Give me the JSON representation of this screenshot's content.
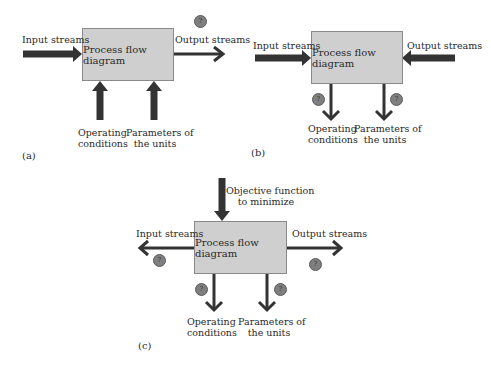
{
  "colors": {
    "box_fill": "#cfcfcf",
    "box_border": "#8a8a8a",
    "arrow": "#333333",
    "question_marker": "#7f7f7f"
  },
  "question_marker": {
    "icon": "question-circle-icon",
    "glyph": "?"
  },
  "panels": [
    {
      "tag": "(a)",
      "box_label": "Process flow diagram",
      "input_label": "Input streams",
      "output_label": "Output streams",
      "operating_label_1": "Operating",
      "operating_label_2": "conditions",
      "parameters_label_1": "Parameters of",
      "parameters_label_2": "the units",
      "unknown": [
        "output streams"
      ]
    },
    {
      "tag": "(b)",
      "box_label": "Process flow diagram",
      "input_label": "Input streams",
      "output_label": "Output streams",
      "operating_label_1": "Operating",
      "operating_label_2": "conditions",
      "parameters_label_1": "Parameters of",
      "parameters_label_2": "the units",
      "unknown": [
        "operating conditions",
        "parameters of the units"
      ]
    },
    {
      "tag": "(c)",
      "box_label": "Process flow diagram",
      "objective_label_1": "Objective function",
      "objective_label_2": "to minimize",
      "input_label": "Input streams",
      "output_label": "Output streams",
      "operating_label_1": "Operating",
      "operating_label_2": "conditions",
      "parameters_label_1": "Parameters of",
      "parameters_label_2": "the units",
      "unknown": [
        "input streams",
        "output streams",
        "operating conditions",
        "parameters of the units"
      ]
    }
  ]
}
